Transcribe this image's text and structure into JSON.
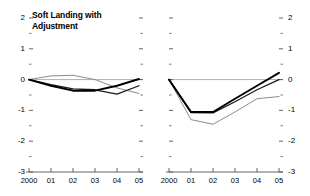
{
  "figure": {
    "background": "#ffffff",
    "panel_count": 2
  },
  "chart_data": [
    {
      "type": "line",
      "title": "Soft Landing with\nAdjustment",
      "xlabel": "",
      "ylabel": "",
      "x": [
        2000,
        2001,
        2002,
        2003,
        2004,
        2005
      ],
      "tick_labels_x": [
        "2000",
        "01",
        "02",
        "03",
        "04",
        "05"
      ],
      "tick_labels_y": [
        "2",
        "1",
        "0",
        "-1",
        "-2",
        "-3"
      ],
      "ylim": [
        -3,
        2
      ],
      "yticks": [
        2,
        1,
        0,
        -1,
        -2,
        -3
      ],
      "yminor": [
        1.5,
        0.5,
        -0.5,
        -1.5,
        -2.5
      ],
      "grid": false,
      "legend": "none",
      "zero_line": true,
      "series": [
        {
          "name": "series-gray-upper",
          "color": "#8c8c8c",
          "width": 1.0,
          "values": [
            0.0,
            0.12,
            0.14,
            0.0,
            -0.27,
            -0.45
          ]
        },
        {
          "name": "series-black-thin",
          "color": "#1a1a1a",
          "width": 1.3,
          "values": [
            0.0,
            -0.16,
            -0.3,
            -0.33,
            -0.47,
            -0.2
          ]
        },
        {
          "name": "series-black-thick",
          "color": "#000000",
          "width": 1.9,
          "values": [
            0.0,
            -0.2,
            -0.36,
            -0.36,
            -0.2,
            0.02
          ]
        }
      ]
    },
    {
      "type": "line",
      "title": "Harder Landing",
      "xlabel": "",
      "ylabel": "",
      "x": [
        2000,
        2001,
        2002,
        2003,
        2004,
        2005
      ],
      "tick_labels_x": [
        "2000",
        "01",
        "02",
        "03",
        "04",
        "05"
      ],
      "tick_labels_y": [
        "2",
        "1",
        "0",
        "-1",
        "-2",
        "-3"
      ],
      "ylim": [
        -3,
        2
      ],
      "yticks": [
        2,
        1,
        0,
        -1,
        -2,
        -3
      ],
      "yminor": [
        1.5,
        0.5,
        -0.5,
        -1.5,
        -2.5
      ],
      "grid": false,
      "legend": "none",
      "zero_line": true,
      "series": [
        {
          "name": "series-gray-lower",
          "color": "#8c8c8c",
          "width": 1.0,
          "values": [
            0.0,
            -1.3,
            -1.45,
            -1.05,
            -0.62,
            -0.55
          ]
        },
        {
          "name": "series-black-thin",
          "color": "#1a1a1a",
          "width": 1.3,
          "values": [
            0.0,
            -1.07,
            -1.08,
            -0.72,
            -0.33,
            0.0
          ]
        },
        {
          "name": "series-black-thick",
          "color": "#000000",
          "width": 1.9,
          "values": [
            0.0,
            -1.05,
            -1.05,
            -0.62,
            -0.2,
            0.22
          ]
        }
      ]
    }
  ]
}
